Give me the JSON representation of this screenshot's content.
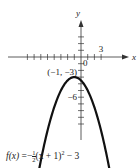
{
  "chart_data": {
    "type": "line",
    "title": "",
    "function_label": {
      "name": "f(x)",
      "equals": "=",
      "sign": "−",
      "frac_num": "1",
      "frac_den": "2",
      "body": "(x + 1)",
      "exponent": "2",
      "tail": " − 3"
    },
    "xlabel": "x",
    "ylabel": "y",
    "origin_label": "0",
    "xlim": [
      -9,
      5
    ],
    "ylim": [
      -11,
      8
    ],
    "x_ticks": [
      -8,
      -7,
      -6,
      -5,
      -4,
      -3,
      -2,
      -1,
      1,
      2,
      3
    ],
    "y_ticks": [
      3,
      2,
      1,
      -1,
      -2,
      -3,
      -4,
      -5,
      -6,
      -7,
      -8,
      -9,
      -10
    ],
    "x_tick_labels": [
      {
        "value": 3,
        "text": "3"
      }
    ],
    "y_tick_labels": [
      {
        "value": -6,
        "text": "−6"
      }
    ],
    "vertex": {
      "x": -1,
      "y": -3,
      "label": "(−1, −3)"
    },
    "curve": {
      "a": -0.5,
      "h": -1,
      "k": -3,
      "x_range": [
        -6.3,
        4.3
      ]
    },
    "colors": {
      "curve": "#111111",
      "axis": "#333333"
    }
  }
}
